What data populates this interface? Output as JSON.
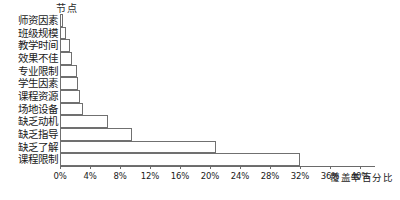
{
  "chart_data": {
    "type": "bar",
    "orientation": "horizontal",
    "title": "",
    "ylabel": "节点",
    "xlabel": "覆盖率百分比",
    "categories": [
      "师资因素",
      "班级规模",
      "教学时间",
      "效果不佳",
      "专业限制",
      "学生因素",
      "课程资源",
      "场地设备",
      "缺乏动机",
      "缺乏指导",
      "缺乏了解",
      "课程限制"
    ],
    "values": [
      0.4,
      0.8,
      1.3,
      1.6,
      2.2,
      2.4,
      2.6,
      3.0,
      6.4,
      9.6,
      20.8,
      32.0
    ],
    "value_unit": "%",
    "xlim": [
      0,
      42
    ],
    "xticks": [
      0,
      4,
      8,
      12,
      16,
      20,
      24,
      28,
      32,
      36,
      40
    ],
    "xtick_labels": [
      "0%",
      "4%",
      "8%",
      "12%",
      "16%",
      "20%",
      "24%",
      "28%",
      "32%",
      "36%",
      "40%"
    ],
    "grid": false,
    "legend": null,
    "bar_fill": "#ffffff",
    "bar_border": "#707070",
    "axis_color": "#6a6a6a"
  }
}
